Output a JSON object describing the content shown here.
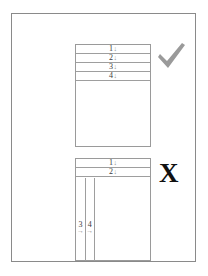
{
  "page": {
    "background_color": "#ffffff",
    "frame_color": "#8a8a8a",
    "box_border_color": "#9a9a9a",
    "line_color": "#9e9e9e",
    "label_color": "#3a3a3a",
    "arrow_color": "#8f8f8f"
  },
  "diagrams": [
    {
      "id": "good-example",
      "verdict": "check",
      "verdict_color": "#9a9a9a",
      "layout": "horizontal-stacked-rows",
      "rows": [
        {
          "number": "1",
          "arrow": "↓"
        },
        {
          "number": "2",
          "arrow": "↓"
        },
        {
          "number": "3",
          "arrow": "↓"
        },
        {
          "number": "4",
          "arrow": "↓"
        }
      ],
      "columns": []
    },
    {
      "id": "bad-example",
      "verdict": "x",
      "verdict_color": "#111111",
      "verdict_glyph": "X",
      "layout": "rows-then-vertical-columns",
      "rows": [
        {
          "number": "1",
          "arrow": "↓"
        },
        {
          "number": "2",
          "arrow": "↓"
        }
      ],
      "columns": [
        {
          "number": "3",
          "arrow": "→"
        },
        {
          "number": "4",
          "arrow": "→"
        },
        {
          "number": "",
          "arrow": ""
        }
      ]
    }
  ]
}
